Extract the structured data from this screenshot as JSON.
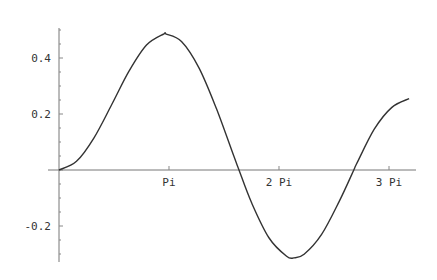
{
  "chart_data": {
    "type": "line",
    "title": "",
    "xlabel": "",
    "ylabel": "",
    "xlim": [
      0,
      10.35
    ],
    "ylim": [
      -0.33,
      0.51
    ],
    "grid": false,
    "legend": null,
    "x_ticks": [
      {
        "value": 3.14159,
        "label": "Pi"
      },
      {
        "value": 6.28318,
        "label": "2 Pi"
      },
      {
        "value": 9.42478,
        "label": "3 Pi"
      }
    ],
    "y_ticks": [
      {
        "value": 0.4,
        "label": "0.4"
      },
      {
        "value": 0.2,
        "label": "0.2"
      },
      {
        "value": -0.2,
        "label": "-0.2"
      }
    ],
    "series": [
      {
        "name": "curve",
        "color": "#333333",
        "x": [
          0,
          0.5,
          1.0,
          1.5,
          2.0,
          2.5,
          3.0,
          3.05,
          3.5,
          4.0,
          4.5,
          5.0,
          5.14,
          5.5,
          6.0,
          6.5,
          6.71,
          7.0,
          7.5,
          8.0,
          8.42,
          8.5,
          9.0,
          9.5,
          10.0
        ],
        "values": [
          0,
          0.031,
          0.115,
          0.232,
          0.353,
          0.446,
          0.486,
          0.486,
          0.459,
          0.364,
          0.218,
          0.047,
          0.0,
          -0.117,
          -0.243,
          -0.308,
          -0.314,
          -0.301,
          -0.23,
          -0.113,
          0.0,
          0.022,
          0.145,
          0.223,
          0.255
        ]
      }
    ]
  }
}
